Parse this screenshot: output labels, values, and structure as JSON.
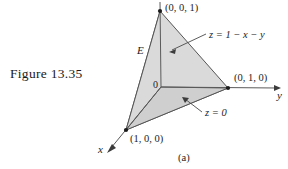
{
  "figure": {
    "caption": "Figure 13.35",
    "panel_label": "(a)"
  },
  "diagram": {
    "type": "3d-tetrahedron-region",
    "region_label": "E",
    "origin_label": "0",
    "axis_labels": {
      "x": "x",
      "y": "y"
    },
    "vertices": [
      {
        "name": "apex",
        "label": "(0, 0, 1)",
        "px": [
          160,
          11
        ]
      },
      {
        "name": "y-intercept",
        "label": "(0, 1, 0)",
        "px": [
          228,
          88
        ]
      },
      {
        "name": "x-intercept",
        "label": "(1, 0, 0)",
        "px": [
          126,
          130
        ]
      },
      {
        "name": "origin",
        "label": "0",
        "px": [
          161,
          87
        ]
      }
    ],
    "annotations": [
      {
        "name": "slant-plane",
        "text": "z = 1 − x − y"
      },
      {
        "name": "base-plane",
        "text": "z = 0"
      }
    ],
    "colors": {
      "stroke": "#4a4a4a",
      "face_left": "#d2d2d2",
      "face_front": "#d9d9d9",
      "face_bottom": "#cfcfcf",
      "vertex_dot": "#1a1a1a",
      "background": "#ffffff"
    }
  }
}
